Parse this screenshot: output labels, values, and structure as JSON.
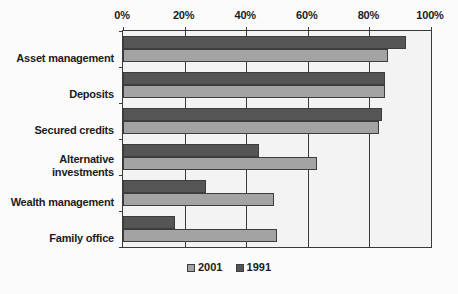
{
  "chart_data": {
    "type": "bar",
    "orientation": "horizontal",
    "title": "",
    "subtitle": "",
    "xlabel": "",
    "ylabel": "",
    "xlim": [
      0,
      100
    ],
    "xticks": [
      0,
      20,
      40,
      60,
      80,
      100
    ],
    "xtick_labels": [
      "0%",
      "20%",
      "40%",
      "60%",
      "80%",
      "100%"
    ],
    "grid": true,
    "legend_position": "bottom",
    "categories": [
      "Asset management",
      "Deposits",
      "Secured credits",
      "Alternative\ninvestments",
      "Wealth management",
      "Family office"
    ],
    "series": [
      {
        "name": "2001",
        "color": "#a3a3a3",
        "values": [
          86,
          85,
          83,
          63,
          49,
          50
        ]
      },
      {
        "name": "1991",
        "color": "#555555",
        "values": [
          92,
          85,
          84,
          44,
          27,
          17
        ]
      }
    ],
    "legend": [
      {
        "label": "2001",
        "color": "#a3a3a3"
      },
      {
        "label": "1991",
        "color": "#555555"
      }
    ]
  }
}
